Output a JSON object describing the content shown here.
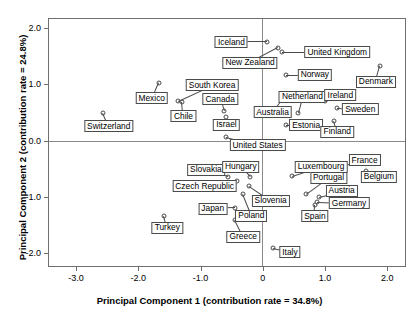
{
  "chart_data": {
    "type": "scatter",
    "title": "",
    "xlabel": "Principal Component 1 (contribution rate = 34.8%)",
    "ylabel": "Principal Component 2 (contribution rate = 24.8%)",
    "xlim": [
      -3.45,
      2.3
    ],
    "ylim": [
      -2.25,
      2.18
    ],
    "xticks": [
      -3.0,
      -2.0,
      -1.0,
      0,
      1.0,
      2.0
    ],
    "xticklabels": [
      "-3.0",
      "-2.0",
      "-1.0",
      "0",
      "1.0",
      "2.0"
    ],
    "yticks": [
      2.0,
      1.0,
      0.0,
      -1.0,
      -2.0
    ],
    "yticklabels": [
      "2.0",
      "1.0",
      "0.0",
      "-1.0",
      "-2.0"
    ],
    "grid": false,
    "legend": "none",
    "zero_lines": {
      "horizontal": 0.0,
      "vertical": 0.0
    },
    "marker": "open-circle",
    "points": [
      {
        "label": "Iceland",
        "x": 0.05,
        "y": 1.77,
        "lx": -0.52,
        "ly": 1.77
      },
      {
        "label": "United Kingdom",
        "x": 0.3,
        "y": 1.59,
        "lx": 1.18,
        "ly": 1.59
      },
      {
        "label": "New Zealand",
        "x": 0.23,
        "y": 1.66,
        "lx": -0.22,
        "ly": 1.4
      },
      {
        "label": "Norway",
        "x": 0.36,
        "y": 1.19,
        "lx": 0.82,
        "ly": 1.19
      },
      {
        "label": "Denmark",
        "x": 1.87,
        "y": 1.34,
        "lx": 1.8,
        "ly": 1.06
      },
      {
        "label": "Mexico",
        "x": -1.69,
        "y": 1.05,
        "lx": -1.8,
        "ly": 0.77
      },
      {
        "label": "South Korea",
        "x": -1.38,
        "y": 0.72,
        "lx": -0.83,
        "ly": 1.0
      },
      {
        "label": "Chile",
        "x": -1.31,
        "y": 0.7,
        "lx": -1.29,
        "ly": 0.45
      },
      {
        "label": "Canada",
        "x": -0.64,
        "y": 0.55,
        "lx": -0.7,
        "ly": 0.75
      },
      {
        "label": "Netherland",
        "x": 0.55,
        "y": 0.51,
        "lx": 0.62,
        "ly": 0.8
      },
      {
        "label": "Ireland",
        "x": 0.98,
        "y": 0.73,
        "lx": 1.23,
        "ly": 0.82
      },
      {
        "label": "Sweden",
        "x": 1.18,
        "y": 0.59,
        "lx": 1.55,
        "ly": 0.57
      },
      {
        "label": "Australia",
        "x": 0.32,
        "y": 0.78,
        "lx": 0.14,
        "ly": 0.52
      },
      {
        "label": "Estonia",
        "x": 0.36,
        "y": 0.29,
        "lx": 0.68,
        "ly": 0.29
      },
      {
        "label": "Israel",
        "x": -0.6,
        "y": 0.43,
        "lx": -0.6,
        "ly": 0.3
      },
      {
        "label": "Finland",
        "x": 1.13,
        "y": 0.36,
        "lx": 1.18,
        "ly": 0.17
      },
      {
        "label": "Switzerland",
        "x": -2.58,
        "y": 0.5,
        "lx": -2.49,
        "ly": 0.27
      },
      {
        "label": "United States",
        "x": -0.6,
        "y": 0.08,
        "lx": -0.1,
        "ly": -0.07
      },
      {
        "label": "France",
        "x": 1.18,
        "y": -0.45,
        "lx": 1.62,
        "ly": -0.33
      },
      {
        "label": "Belgium",
        "x": 1.64,
        "y": -0.53,
        "lx": 1.85,
        "ly": -0.63
      },
      {
        "label": "Luxembourg",
        "x": 0.45,
        "y": -0.62,
        "lx": 0.92,
        "ly": -0.45
      },
      {
        "label": "Slovakia",
        "x": -0.58,
        "y": -0.63,
        "lx": -0.93,
        "ly": -0.5
      },
      {
        "label": "Hungary",
        "x": -0.22,
        "y": -0.63,
        "lx": -0.37,
        "ly": -0.45
      },
      {
        "label": "Czech Republic",
        "x": -0.43,
        "y": -0.7,
        "lx": -0.95,
        "ly": -0.8
      },
      {
        "label": "Portugal",
        "x": 0.68,
        "y": -0.93,
        "lx": 1.04,
        "ly": -0.64
      },
      {
        "label": "Austria",
        "x": 0.88,
        "y": -0.98,
        "lx": 1.25,
        "ly": -0.88
      },
      {
        "label": "Slovenia",
        "x": -0.23,
        "y": -0.8,
        "lx": 0.11,
        "ly": -1.05
      },
      {
        "label": "Germany",
        "x": 0.85,
        "y": -1.08,
        "lx": 1.37,
        "ly": -1.1
      },
      {
        "label": "Spain",
        "x": 0.83,
        "y": -1.13,
        "lx": 0.82,
        "ly": -1.33
      },
      {
        "label": "Japan",
        "x": -0.46,
        "y": -1.19,
        "lx": -0.82,
        "ly": -1.2
      },
      {
        "label": "Poland",
        "x": -0.34,
        "y": -0.94,
        "lx": -0.2,
        "ly": -1.32
      },
      {
        "label": "Turkey",
        "x": -1.6,
        "y": -1.32,
        "lx": -1.55,
        "ly": -1.53
      },
      {
        "label": "Greece",
        "x": -0.46,
        "y": -1.4,
        "lx": -0.33,
        "ly": -1.69
      },
      {
        "label": "Italy",
        "x": 0.14,
        "y": -1.9,
        "lx": 0.42,
        "ly": -1.97
      }
    ]
  }
}
